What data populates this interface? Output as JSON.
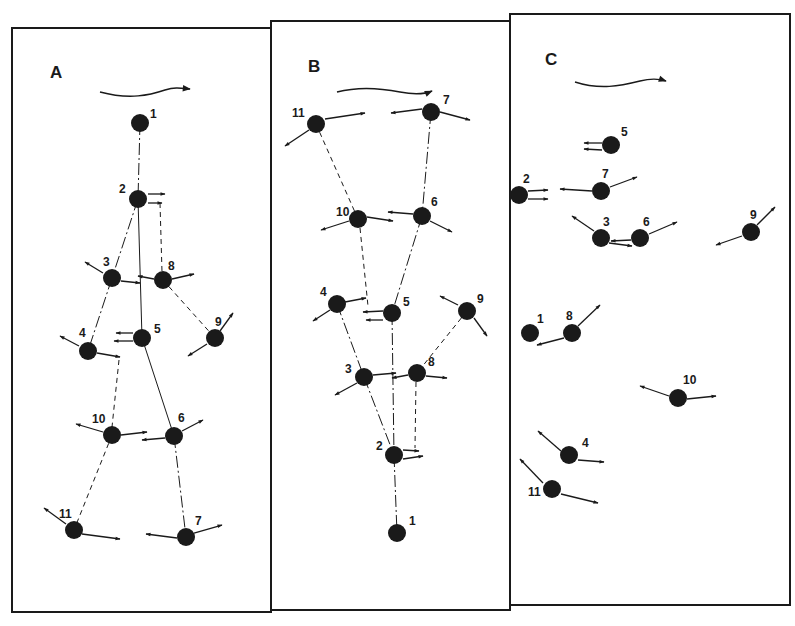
{
  "figure": {
    "panels": [
      {
        "label": "A",
        "frame": {
          "x": 12,
          "y": 28,
          "w": 259,
          "h": 584
        },
        "label_pos": [
          50,
          78
        ],
        "flow_arrow": {
          "path": "M100,92 C130,100 150,95 165,90 C175,87 180,88 190,89",
          "head": [
            193,
            89
          ]
        },
        "nodes": [
          {
            "id": "1",
            "x": 140,
            "y": 123,
            "lx": 150,
            "ly": 118
          },
          {
            "id": "2",
            "x": 138,
            "y": 199,
            "lx": 119,
            "ly": 193
          },
          {
            "id": "3",
            "x": 112,
            "y": 278,
            "lx": 103,
            "ly": 266
          },
          {
            "id": "4",
            "x": 88,
            "y": 351,
            "lx": 79,
            "ly": 337
          },
          {
            "id": "5",
            "x": 142,
            "y": 338,
            "lx": 154,
            "ly": 333
          },
          {
            "id": "6",
            "x": 174,
            "y": 436,
            "lx": 178,
            "ly": 422
          },
          {
            "id": "7",
            "x": 186,
            "y": 537,
            "lx": 195,
            "ly": 525
          },
          {
            "id": "8",
            "x": 163,
            "y": 280,
            "lx": 168,
            "ly": 270
          },
          {
            "id": "9",
            "x": 215,
            "y": 338,
            "lx": 215,
            "ly": 326
          },
          {
            "id": "10",
            "x": 112,
            "y": 435,
            "lx": 92,
            "ly": 423
          },
          {
            "id": "11",
            "x": 74,
            "y": 530,
            "lx": 59,
            "ly": 518
          }
        ],
        "links": [
          {
            "from": "1",
            "to": "2",
            "style": "dashdot"
          },
          {
            "from": "2",
            "to": "3",
            "style": "dashdot"
          },
          {
            "from": "2",
            "to": "5",
            "style": "solid"
          },
          {
            "from": "3",
            "to": "4",
            "style": "dashdot"
          },
          {
            "from": "5",
            "to": "6",
            "style": "solid"
          },
          {
            "from": "6",
            "to": "7",
            "style": "dashdot"
          },
          {
            "from": "10",
            "to": "11",
            "style": "dashed"
          },
          {
            "from": "8",
            "to": "9",
            "style": "dashed"
          }
        ],
        "extra_lines": [
          {
            "x1": 160,
            "y1": 203,
            "x2": 162,
            "y2": 272,
            "style": "dashed"
          },
          {
            "x1": 119,
            "y1": 360,
            "x2": 112,
            "y2": 427,
            "style": "dashed"
          }
        ],
        "arrows": [
          {
            "x1": 148,
            "y1": 194,
            "x2": 165,
            "y2": 194
          },
          {
            "x1": 148,
            "y1": 203,
            "x2": 162,
            "y2": 203
          },
          {
            "x1": 103,
            "y1": 273,
            "x2": 85,
            "y2": 262
          },
          {
            "x1": 121,
            "y1": 281,
            "x2": 140,
            "y2": 283
          },
          {
            "x1": 154,
            "y1": 279,
            "x2": 138,
            "y2": 276
          },
          {
            "x1": 172,
            "y1": 279,
            "x2": 194,
            "y2": 274
          },
          {
            "x1": 79,
            "y1": 346,
            "x2": 60,
            "y2": 336
          },
          {
            "x1": 97,
            "y1": 353,
            "x2": 120,
            "y2": 357
          },
          {
            "x1": 133,
            "y1": 333,
            "x2": 116,
            "y2": 333
          },
          {
            "x1": 133,
            "y1": 341,
            "x2": 114,
            "y2": 341
          },
          {
            "x1": 220,
            "y1": 331,
            "x2": 233,
            "y2": 313
          },
          {
            "x1": 207,
            "y1": 344,
            "x2": 188,
            "y2": 356
          },
          {
            "x1": 103,
            "y1": 432,
            "x2": 76,
            "y2": 424
          },
          {
            "x1": 121,
            "y1": 435,
            "x2": 147,
            "y2": 432
          },
          {
            "x1": 165,
            "y1": 438,
            "x2": 142,
            "y2": 440
          },
          {
            "x1": 182,
            "y1": 431,
            "x2": 203,
            "y2": 420
          },
          {
            "x1": 66,
            "y1": 524,
            "x2": 44,
            "y2": 508
          },
          {
            "x1": 82,
            "y1": 534,
            "x2": 120,
            "y2": 539
          },
          {
            "x1": 177,
            "y1": 538,
            "x2": 146,
            "y2": 534
          },
          {
            "x1": 194,
            "y1": 533,
            "x2": 222,
            "y2": 525
          }
        ]
      },
      {
        "label": "B",
        "frame": {
          "x": 271,
          "y": 21,
          "w": 239,
          "h": 589
        },
        "label_pos": [
          308,
          72
        ],
        "flow_arrow": {
          "path": "M337,92 C360,86 380,88 400,92 C415,95 425,94 432,91",
          "head": [
            436,
            90
          ]
        },
        "nodes": [
          {
            "id": "11",
            "x": 316,
            "y": 124,
            "lx": 292,
            "ly": 117
          },
          {
            "id": "7",
            "x": 431,
            "y": 112,
            "lx": 443,
            "ly": 104
          },
          {
            "id": "10",
            "x": 358,
            "y": 219,
            "lx": 336,
            "ly": 216
          },
          {
            "id": "6",
            "x": 422,
            "y": 216,
            "lx": 431,
            "ly": 206
          },
          {
            "id": "4",
            "x": 337,
            "y": 304,
            "lx": 320,
            "ly": 296
          },
          {
            "id": "5",
            "x": 392,
            "y": 313,
            "lx": 403,
            "ly": 306
          },
          {
            "id": "9",
            "x": 467,
            "y": 311,
            "lx": 477,
            "ly": 303
          },
          {
            "id": "3",
            "x": 364,
            "y": 377,
            "lx": 345,
            "ly": 373
          },
          {
            "id": "8",
            "x": 417,
            "y": 373,
            "lx": 428,
            "ly": 366
          },
          {
            "id": "2",
            "x": 394,
            "y": 455,
            "lx": 376,
            "ly": 450
          },
          {
            "id": "1",
            "x": 397,
            "y": 533,
            "lx": 409,
            "ly": 525
          }
        ],
        "links": [
          {
            "from": "11",
            "to": "10",
            "style": "dashed"
          },
          {
            "from": "7",
            "to": "6",
            "style": "dashdot"
          },
          {
            "from": "6",
            "to": "5",
            "style": "dashdot"
          },
          {
            "from": "4",
            "to": "3",
            "style": "dashdot"
          },
          {
            "from": "3",
            "to": "2",
            "style": "dashdot"
          },
          {
            "from": "5",
            "to": "2",
            "style": "dashdot"
          },
          {
            "from": "9",
            "to": "8",
            "style": "dashed"
          },
          {
            "from": "2",
            "to": "1",
            "style": "dashdot"
          }
        ],
        "extra_lines": [
          {
            "x1": 360,
            "y1": 228,
            "x2": 368,
            "y2": 306,
            "style": "dashed"
          },
          {
            "x1": 416,
            "y1": 382,
            "x2": 415,
            "y2": 448,
            "style": "dashed"
          }
        ],
        "arrows": [
          {
            "x1": 325,
            "y1": 119,
            "x2": 365,
            "y2": 113
          },
          {
            "x1": 309,
            "y1": 130,
            "x2": 285,
            "y2": 146
          },
          {
            "x1": 422,
            "y1": 109,
            "x2": 391,
            "y2": 113
          },
          {
            "x1": 440,
            "y1": 112,
            "x2": 470,
            "y2": 120
          },
          {
            "x1": 349,
            "y1": 221,
            "x2": 321,
            "y2": 230
          },
          {
            "x1": 367,
            "y1": 217,
            "x2": 393,
            "y2": 221
          },
          {
            "x1": 413,
            "y1": 214,
            "x2": 388,
            "y2": 212
          },
          {
            "x1": 430,
            "y1": 221,
            "x2": 452,
            "y2": 232
          },
          {
            "x1": 345,
            "y1": 302,
            "x2": 366,
            "y2": 298
          },
          {
            "x1": 330,
            "y1": 310,
            "x2": 313,
            "y2": 321
          },
          {
            "x1": 383,
            "y1": 311,
            "x2": 363,
            "y2": 312
          },
          {
            "x1": 383,
            "y1": 320,
            "x2": 366,
            "y2": 320
          },
          {
            "x1": 458,
            "y1": 305,
            "x2": 440,
            "y2": 296
          },
          {
            "x1": 474,
            "y1": 318,
            "x2": 487,
            "y2": 336
          },
          {
            "x1": 373,
            "y1": 375,
            "x2": 396,
            "y2": 373
          },
          {
            "x1": 357,
            "y1": 383,
            "x2": 335,
            "y2": 395
          },
          {
            "x1": 408,
            "y1": 375,
            "x2": 392,
            "y2": 378
          },
          {
            "x1": 426,
            "y1": 376,
            "x2": 447,
            "y2": 378
          },
          {
            "x1": 403,
            "y1": 450,
            "x2": 419,
            "y2": 451
          },
          {
            "x1": 403,
            "y1": 459,
            "x2": 423,
            "y2": 456
          }
        ]
      },
      {
        "label": "C",
        "frame": {
          "x": 510,
          "y": 14,
          "w": 280,
          "h": 591
        },
        "label_pos": [
          545,
          65
        ],
        "flow_arrow": {
          "path": "M575,82 C600,90 620,86 640,81 C652,78 660,79 666,81",
          "head": [
            670,
            82
          ]
        },
        "nodes": [
          {
            "id": "5",
            "x": 611,
            "y": 145,
            "lx": 621,
            "ly": 136
          },
          {
            "id": "2",
            "x": 519,
            "y": 195,
            "lx": 523,
            "ly": 183
          },
          {
            "id": "7",
            "x": 601,
            "y": 191,
            "lx": 602,
            "ly": 178
          },
          {
            "id": "3",
            "x": 601,
            "y": 238,
            "lx": 603,
            "ly": 226
          },
          {
            "id": "6",
            "x": 640,
            "y": 238,
            "lx": 643,
            "ly": 226
          },
          {
            "id": "9",
            "x": 751,
            "y": 232,
            "lx": 750,
            "ly": 219
          },
          {
            "id": "1",
            "x": 530,
            "y": 333,
            "lx": 537,
            "ly": 323
          },
          {
            "id": "8",
            "x": 572,
            "y": 333,
            "lx": 566,
            "ly": 320
          },
          {
            "id": "10",
            "x": 678,
            "y": 398,
            "lx": 683,
            "ly": 384
          },
          {
            "id": "4",
            "x": 569,
            "y": 455,
            "lx": 582,
            "ly": 447
          },
          {
            "id": "11",
            "x": 552,
            "y": 489,
            "lx": 528,
            "ly": 496
          }
        ],
        "links": [],
        "extra_lines": [],
        "arrows": [
          {
            "x1": 602,
            "y1": 143,
            "x2": 584,
            "y2": 143
          },
          {
            "x1": 602,
            "y1": 150,
            "x2": 584,
            "y2": 149
          },
          {
            "x1": 528,
            "y1": 191,
            "x2": 548,
            "y2": 190
          },
          {
            "x1": 528,
            "y1": 199,
            "x2": 548,
            "y2": 199
          },
          {
            "x1": 592,
            "y1": 191,
            "x2": 560,
            "y2": 189
          },
          {
            "x1": 610,
            "y1": 187,
            "x2": 637,
            "y2": 177
          },
          {
            "x1": 594,
            "y1": 231,
            "x2": 572,
            "y2": 216
          },
          {
            "x1": 609,
            "y1": 243,
            "x2": 632,
            "y2": 246
          },
          {
            "x1": 631,
            "y1": 240,
            "x2": 611,
            "y2": 241
          },
          {
            "x1": 649,
            "y1": 234,
            "x2": 677,
            "y2": 222
          },
          {
            "x1": 757,
            "y1": 225,
            "x2": 775,
            "y2": 207
          },
          {
            "x1": 742,
            "y1": 236,
            "x2": 716,
            "y2": 245
          },
          {
            "x1": 564,
            "y1": 338,
            "x2": 537,
            "y2": 345
          },
          {
            "x1": 578,
            "y1": 326,
            "x2": 600,
            "y2": 305
          },
          {
            "x1": 669,
            "y1": 396,
            "x2": 640,
            "y2": 386
          },
          {
            "x1": 687,
            "y1": 399,
            "x2": 716,
            "y2": 396
          },
          {
            "x1": 561,
            "y1": 451,
            "x2": 538,
            "y2": 431
          },
          {
            "x1": 578,
            "y1": 460,
            "x2": 604,
            "y2": 462
          },
          {
            "x1": 543,
            "y1": 483,
            "x2": 520,
            "y2": 459
          },
          {
            "x1": 561,
            "y1": 494,
            "x2": 598,
            "y2": 503
          }
        ]
      }
    ],
    "style": {
      "ink": "#1a1a1a",
      "node_radius": 9
    }
  }
}
